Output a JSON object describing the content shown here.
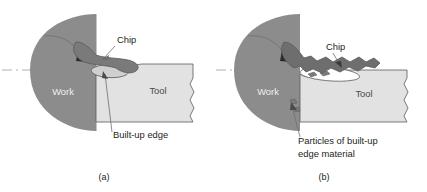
{
  "figure": {
    "panels": [
      {
        "id": "a",
        "caption": "(a)",
        "labels": {
          "work": "Work",
          "tool": "Tool",
          "chip": "Chip",
          "feature": "Built-up edge"
        }
      },
      {
        "id": "b",
        "caption": "(b)",
        "labels": {
          "work": "Work",
          "tool": "Tool",
          "chip": "Chip",
          "feature_line1": "Particles of built-up",
          "feature_line2": "edge material"
        }
      }
    ]
  },
  "colors": {
    "work_fill": "#8c8c8c",
    "chip_fill": "#7a7a7a",
    "chip_fill_b": "#6e6e6e",
    "tool_fill": "#e2e2e2",
    "tool_fill_dark": "#d4d4d4",
    "outline": "#5a5a5a",
    "leader": "#6f6f6f",
    "centerline": "#9a9aa8",
    "text": "#231f20",
    "text_on_work": "#efefef",
    "background": "#ffffff"
  },
  "icons": {
    "rotation_arrow": "curved-rotation-arrow-icon",
    "centerline": "axis-centerline-icon",
    "break_edge": "broken-edge-icon"
  }
}
